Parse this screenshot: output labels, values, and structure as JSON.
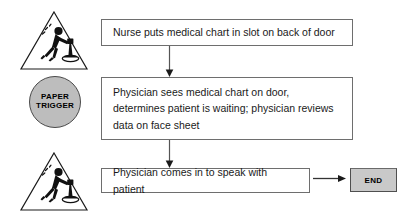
{
  "diagram": {
    "colors": {
      "box_border": "#6e6e6e",
      "box_fill": "#ffffff",
      "trigger_fill": "#bdbdbd",
      "trigger_border": "#4a4a4a",
      "end_fill": "#c9c9c9",
      "end_border": "#4f4f4f",
      "connector": "#555555",
      "text": "#1a1a1a"
    },
    "triggers": {
      "top_symbol": "trigger-warning-triangle-icon",
      "bottom_symbol": "trigger-warning-triangle-icon",
      "paper_trigger": {
        "line1": "PAPER",
        "line2": "TRIGGER"
      }
    },
    "steps": [
      {
        "id": "nurse-chart",
        "text": "Nurse puts medical chart in slot on back of door"
      },
      {
        "id": "physician-sees",
        "text": "Physician sees medical chart on door,\ndetermines patient is waiting; physician reviews\ndata on face sheet"
      },
      {
        "id": "physician-speaks",
        "text": "Physician comes in to speak with patient"
      }
    ],
    "terminator": {
      "label": "END"
    },
    "connectors": [
      {
        "id": "nurse-to-physician",
        "direction": "down"
      },
      {
        "id": "physician-to-speak",
        "direction": "down"
      },
      {
        "id": "speak-to-end",
        "direction": "right"
      }
    ]
  }
}
